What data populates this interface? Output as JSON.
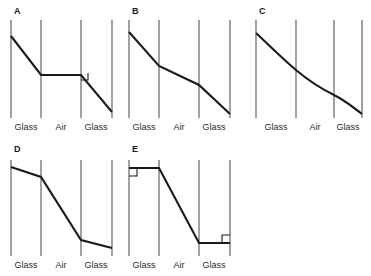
{
  "figure": {
    "type": "multi-panel-ray-diagram",
    "background_color": "#ffffff",
    "boundary_color": "#555555",
    "ray_color": "#1a1a1a",
    "width": 371,
    "height": 276,
    "region_labels": [
      "Glass",
      "Air",
      "Glass"
    ],
    "panels": [
      {
        "letter": "A",
        "letter_x": 14,
        "letter_y": 14,
        "origin_x": 0,
        "origin_y": 0,
        "boundaries_x": [
          11,
          41,
          81,
          112
        ],
        "boundary_top_y": 20,
        "boundary_bottom_y": 118,
        "label_y": 130,
        "label_x": [
          26,
          61,
          96
        ],
        "ray": "M 11,36 L 41,75 L 81,75 L 112,112",
        "angle_marks": [
          "M 81,80 L 88,80 L 88,73"
        ],
        "description": "Ray bends down in first glass, travels horizontally across air, then bends down again in second glass with right-angle marker"
      },
      {
        "letter": "B",
        "letter_x": 132,
        "letter_y": 14,
        "origin_x": 118,
        "origin_y": 0,
        "boundaries_x": [
          129,
          159,
          199,
          230
        ],
        "boundary_top_y": 20,
        "boundary_bottom_y": 118,
        "label_y": 130,
        "label_x": [
          144,
          179,
          214
        ],
        "ray": "M 129,32 L 159,66 L 199,85 L 230,114",
        "angle_marks": [],
        "description": "Continuously descending ray, steep in glass, shallow in air, steep again in glass"
      },
      {
        "letter": "C",
        "letter_x": 259,
        "letter_y": 14,
        "origin_x": 240,
        "origin_y": 0,
        "boundaries_x": [
          256,
          296,
          334,
          362
        ],
        "boundary_top_y": 20,
        "boundary_bottom_y": 118,
        "label_y": 130,
        "label_x": [
          276,
          315,
          348
        ],
        "ray": "M 256,33 C 272,48 284,60 296,70 C 310,82 322,89 334,95 C 346,101 354,108 362,114",
        "angle_marks": [],
        "description": "Smooth curved ray, continuously bending, steepening after third boundary"
      },
      {
        "letter": "D",
        "letter_x": 14,
        "letter_y": 152,
        "origin_x": 0,
        "origin_y": 138,
        "boundaries_x": [
          11,
          41,
          81,
          112
        ],
        "boundary_top_y": 160,
        "boundary_bottom_y": 256,
        "label_y": 268,
        "label_x": [
          26,
          61,
          96
        ],
        "ray": "M 11,167 L 41,177 L 81,240 L 112,248",
        "angle_marks": [],
        "description": "Shallow descent in glass, steep descent through air, shallow descent in second glass"
      },
      {
        "letter": "E",
        "letter_x": 132,
        "letter_y": 152,
        "origin_x": 118,
        "origin_y": 138,
        "boundaries_x": [
          129,
          159,
          199,
          230
        ],
        "boundary_top_y": 160,
        "boundary_bottom_y": 256,
        "label_y": 268,
        "label_x": [
          144,
          179,
          214
        ],
        "ray": "M 129,168 L 159,168 L 199,243 L 230,243",
        "angle_marks": [
          "M 129,176 L 137,176 L 137,168",
          "M 222,243 L 222,235 L 230,235"
        ],
        "description": "Horizontal in glass with right-angle marker, steep diagonal through air, horizontal in second glass with right-angle marker"
      }
    ]
  }
}
